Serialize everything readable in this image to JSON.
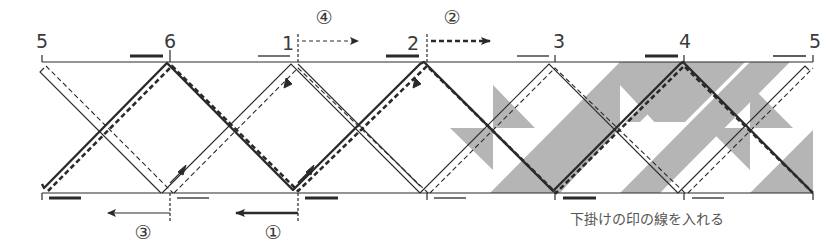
{
  "diagram": {
    "type": "braid-weaving-pattern",
    "colors": {
      "line": "#2a2a2a",
      "shade": "#b3b3b3",
      "background": "#ffffff",
      "text": "#3a3a3a"
    },
    "position_labels": [
      {
        "id": "pos-5-left",
        "text": "5",
        "x": 42
      },
      {
        "id": "pos-6",
        "text": "6",
        "x": 170
      },
      {
        "id": "pos-1",
        "text": "1",
        "x": 289
      },
      {
        "id": "pos-2",
        "text": "2",
        "x": 413
      },
      {
        "id": "pos-3",
        "text": "3",
        "x": 560
      },
      {
        "id": "pos-4",
        "text": "4",
        "x": 685
      },
      {
        "id": "pos-5-right",
        "text": "5",
        "x": 815
      }
    ],
    "steps": [
      {
        "id": "step-1",
        "text": "①",
        "direction": "left",
        "arrow_style": "solid-bold",
        "position": "bottom"
      },
      {
        "id": "step-2",
        "text": "②",
        "direction": "right",
        "arrow_style": "dashed-bold",
        "position": "top"
      },
      {
        "id": "step-3",
        "text": "③",
        "direction": "left",
        "arrow_style": "solid-thin",
        "position": "bottom"
      },
      {
        "id": "step-4",
        "text": "④",
        "direction": "right",
        "arrow_style": "dashed-thin",
        "position": "top"
      }
    ],
    "caption": "下掛けの印の線を入れる",
    "legend_marks": {
      "bold_bar": "upper strand mark (thick)",
      "thin_bar": "lower strand mark (thin)"
    }
  }
}
